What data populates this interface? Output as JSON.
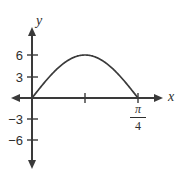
{
  "figure": {
    "background_color": "#ffffff",
    "ink_color": "#3a3a3a"
  },
  "axes": {
    "x_label": "x",
    "y_label": "y"
  },
  "labels": {
    "pi_numerator": "π",
    "pi_denominator": "4"
  },
  "chart_data": {
    "type": "line",
    "title": "",
    "subtitle": "",
    "xlabel": "x",
    "ylabel": "y",
    "grid": false,
    "legend": null,
    "function": "y = 6 sin(4x)",
    "xlim": [
      -0.0982,
      0.9817
    ],
    "ylim": [
      -9.0,
      9.0
    ],
    "x_ticks": [
      0.3927
    ],
    "x_tick_labels": [
      "π/4"
    ],
    "x_tick_marks_unlabeled": [
      0.19635
    ],
    "y_ticks": [
      -6,
      -3,
      3,
      6
    ],
    "y_tick_labels": [
      "−6",
      "−3",
      "3",
      "6"
    ],
    "annotations": [
      {
        "text": "π/4",
        "x": 0.7854,
        "y": -1.6,
        "note": "fraction label below x-axis at right zero of the arch"
      }
    ],
    "x": [
      0.0,
      0.03927,
      0.07854,
      0.11781,
      0.15708,
      0.19635,
      0.23562,
      0.27489,
      0.31416,
      0.35343,
      0.3927
    ],
    "values": [
      0.0,
      1.854,
      3.527,
      4.854,
      5.706,
      6.0,
      5.706,
      4.854,
      3.527,
      1.854,
      0.0
    ],
    "series": [
      {
        "name": "y = 6 sin(4x)",
        "x": [
          0.0,
          0.03927,
          0.07854,
          0.11781,
          0.15708,
          0.19635,
          0.23562,
          0.27489,
          0.31416,
          0.35343,
          0.3927
        ],
        "values": [
          0.0,
          1.854,
          3.527,
          4.854,
          5.706,
          6.0,
          5.706,
          4.854,
          3.527,
          1.854,
          0.0
        ]
      }
    ],
    "peak": {
      "x": 0.19635,
      "y": 6
    },
    "zeros": [
      0.0,
      0.3927
    ]
  }
}
